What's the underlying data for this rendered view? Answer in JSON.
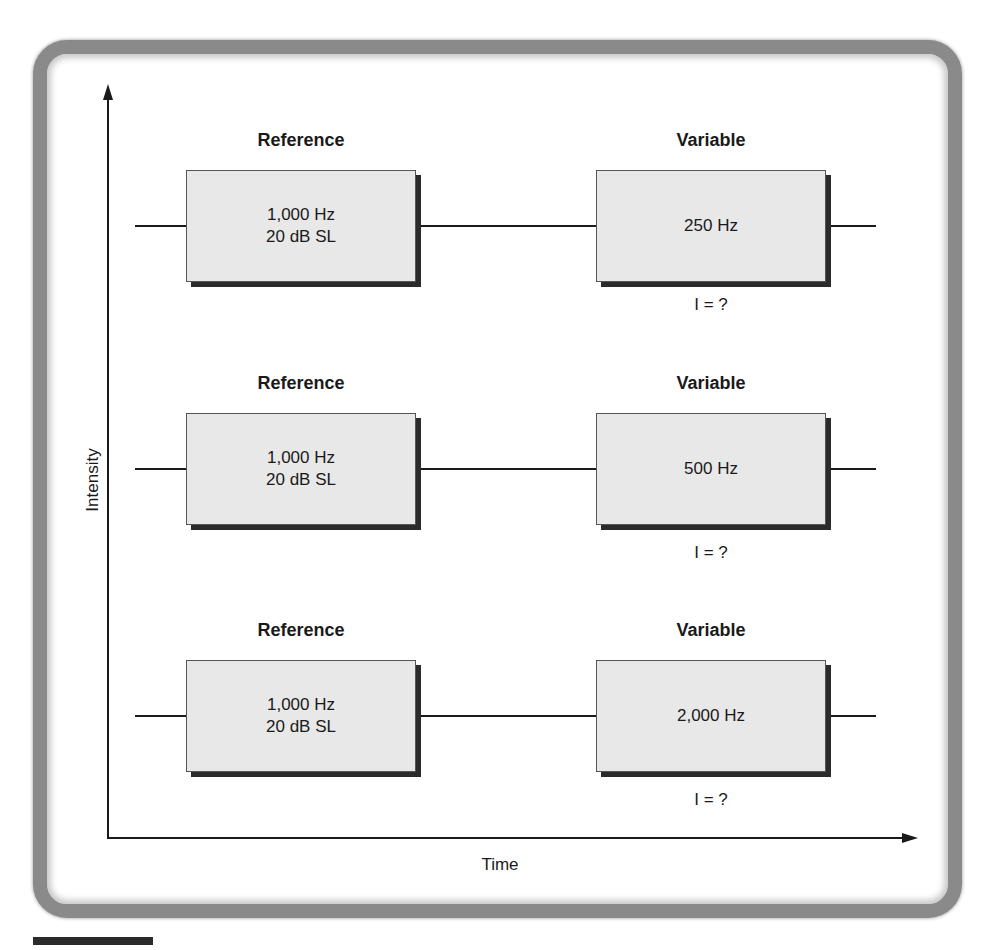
{
  "diagram": {
    "y_axis_label": "Intensity",
    "x_axis_label": "Time",
    "rows": [
      {
        "reference": {
          "heading": "Reference",
          "line1": "1,000 Hz",
          "line2": "20 dB SL"
        },
        "variable": {
          "heading": "Variable",
          "line1": "250 Hz",
          "unknown": "I = ?"
        }
      },
      {
        "reference": {
          "heading": "Reference",
          "line1": "1,000 Hz",
          "line2": "20 dB SL"
        },
        "variable": {
          "heading": "Variable",
          "line1": "500 Hz",
          "unknown": "I = ?"
        }
      },
      {
        "reference": {
          "heading": "Reference",
          "line1": "1,000 Hz",
          "line2": "20 dB SL"
        },
        "variable": {
          "heading": "Variable",
          "line1": "2,000 Hz",
          "unknown": "I = ?"
        }
      }
    ]
  },
  "colors": {
    "box_fill": "#e8e8e8",
    "box_shadow": "#2b2b2b",
    "frame_border": "#8a8a8a",
    "ink": "#1a1a1a"
  }
}
